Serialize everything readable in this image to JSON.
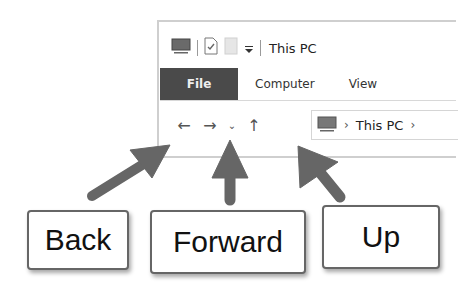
{
  "window": {
    "title": "This PC",
    "quick_access": {
      "icons": [
        "computer-icon",
        "properties-check-icon",
        "new-folder-icon",
        "customize-dropdown-icon"
      ]
    },
    "ribbon_tabs": [
      {
        "label": "File",
        "active": true
      },
      {
        "label": "Computer"
      },
      {
        "label": "View"
      }
    ],
    "nav": {
      "back_glyph": "←",
      "forward_glyph": "→",
      "recent_glyph": "⌄",
      "up_glyph": "↑"
    },
    "address_bar": {
      "segments": [
        "This PC"
      ],
      "separator": "›"
    }
  },
  "callouts": [
    {
      "label": "Back"
    },
    {
      "label": "Forward"
    },
    {
      "label": "Up"
    }
  ],
  "colors": {
    "file_tab": "#4a4a4a",
    "arrow": "#666666",
    "callout_border": "#666666"
  }
}
